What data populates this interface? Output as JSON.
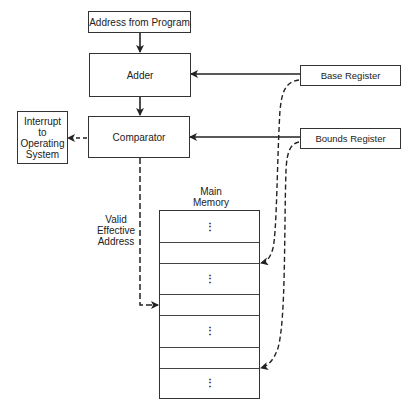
{
  "diagram": {
    "nodes": {
      "address_from_program": "Address from Program",
      "adder": "Adder",
      "comparator": "Comparator",
      "interrupt": [
        "Interrupt",
        "to",
        "Operating",
        "System"
      ],
      "base_register": "Base Register",
      "bounds_register": "Bounds Register",
      "main_memory": [
        "Main",
        "Memory"
      ],
      "valid_effective_address": [
        "Valid",
        "Effective",
        "Address"
      ]
    },
    "memory_cells": [
      {
        "type": "ellipsis",
        "glyph": "⋮"
      },
      {
        "type": "empty",
        "glyph": ""
      },
      {
        "type": "ellipsis",
        "glyph": "⋮"
      },
      {
        "type": "empty",
        "glyph": ""
      },
      {
        "type": "ellipsis",
        "glyph": "⋮"
      },
      {
        "type": "empty",
        "glyph": ""
      },
      {
        "type": "ellipsis",
        "glyph": "⋮"
      }
    ],
    "edges": [
      {
        "from": "Address from Program",
        "to": "Adder",
        "style": "solid"
      },
      {
        "from": "Adder",
        "to": "Comparator",
        "style": "solid"
      },
      {
        "from": "Base Register",
        "to": "Adder",
        "style": "solid"
      },
      {
        "from": "Bounds Register",
        "to": "Comparator",
        "style": "solid"
      },
      {
        "from": "Comparator",
        "to": "Interrupt to Operating System",
        "style": "dashed"
      },
      {
        "from": "Comparator",
        "to": "Main Memory (Valid Effective Address)",
        "style": "dashed"
      },
      {
        "from": "Base Register",
        "to": "Main Memory cell 2",
        "style": "dashed"
      },
      {
        "from": "Bounds Register",
        "to": "Main Memory cell 6",
        "style": "dashed"
      }
    ],
    "colors": {
      "line": "#222222",
      "background": "#ffffff"
    }
  }
}
